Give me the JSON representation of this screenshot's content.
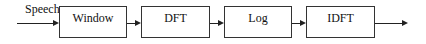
{
  "diagram": {
    "input_label": "Speech",
    "blocks": [
      {
        "label": "Window"
      },
      {
        "label": "DFT"
      },
      {
        "label": "Log"
      },
      {
        "label": "IDFT"
      }
    ],
    "flow": "left-to-right",
    "colors": {
      "stroke": "#222222",
      "background": "#ffffff",
      "text": "#111111"
    }
  }
}
